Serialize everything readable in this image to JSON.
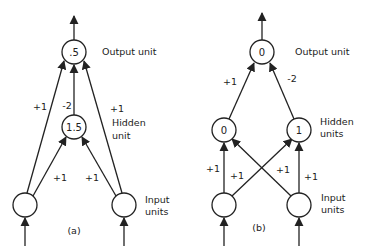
{
  "diagrams": [
    {
      "id": "a",
      "caption": "(a)",
      "labels": {
        "output": "Output unit",
        "hidden_line1": "Hidden",
        "hidden_line2": "unit",
        "input_line1": "Input",
        "input_line2": "units"
      },
      "nodes": {
        "output": {
          "value": ".5"
        },
        "hidden": {
          "value": "1.5"
        },
        "input_left": {
          "value": ""
        },
        "input_right": {
          "value": ""
        }
      },
      "weights": {
        "input_left_to_output": "+1",
        "hidden_to_output": "-2",
        "input_right_to_output": "+1",
        "input_left_to_hidden": "+1",
        "input_right_to_hidden": "+1"
      }
    },
    {
      "id": "b",
      "caption": "(b)",
      "labels": {
        "output": "Output unit",
        "hidden_line1": "Hidden",
        "hidden_line2": "units",
        "input_line1": "Input",
        "input_line2": "units"
      },
      "nodes": {
        "output": {
          "value": "0"
        },
        "hidden_left": {
          "value": "0"
        },
        "hidden_right": {
          "value": "1"
        },
        "input_left": {
          "value": ""
        },
        "input_right": {
          "value": ""
        }
      },
      "weights": {
        "hidden_left_to_output": "+1",
        "hidden_right_to_output": "-2",
        "input_left_to_hidden_left": "+1",
        "input_left_to_hidden_right": "+1",
        "input_right_to_hidden_left": "+1",
        "input_right_to_hidden_right": "+1"
      }
    }
  ]
}
